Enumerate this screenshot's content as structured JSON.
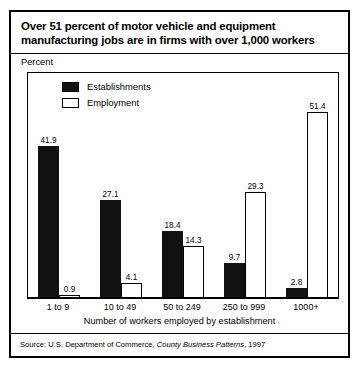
{
  "title": {
    "line1": "Over 51 percent of motor vehicle and equipment",
    "line2": "manufacturing jobs are in firms with over 1,000 workers"
  },
  "axis": {
    "ylabel": "Percent",
    "xlabel": "Number of workers employed by establishment"
  },
  "legend": {
    "items": [
      {
        "label": "Establishments",
        "color": "#111111",
        "style": "filled"
      },
      {
        "label": "Employment",
        "color": "#ffffff",
        "style": "outlined"
      }
    ]
  },
  "source": {
    "prefix": "Source: U.S. Department of Commerce, ",
    "italic": "County Business Patterns",
    "suffix": ", 1997"
  },
  "chart_data": {
    "type": "bar",
    "title": "Over 51 percent of motor vehicle and equipment manufacturing jobs are in firms with over 1,000 workers",
    "xlabel": "Number of workers employed by establishment",
    "ylabel": "Percent",
    "ylim": [
      0,
      55
    ],
    "grid": false,
    "legend_position": "top-left inside plot",
    "categories": [
      "1 to 9",
      "10 to 49",
      "50 to 249",
      "250 to 999",
      "1000+"
    ],
    "series": [
      {
        "name": "Establishments",
        "values": [
          41.9,
          27.1,
          18.4,
          9.7,
          2.8
        ]
      },
      {
        "name": "Employment",
        "values": [
          0.9,
          4.1,
          14.3,
          29.3,
          51.4
        ]
      }
    ],
    "source": "Source: U.S. Department of Commerce, County Business Patterns, 1997"
  }
}
